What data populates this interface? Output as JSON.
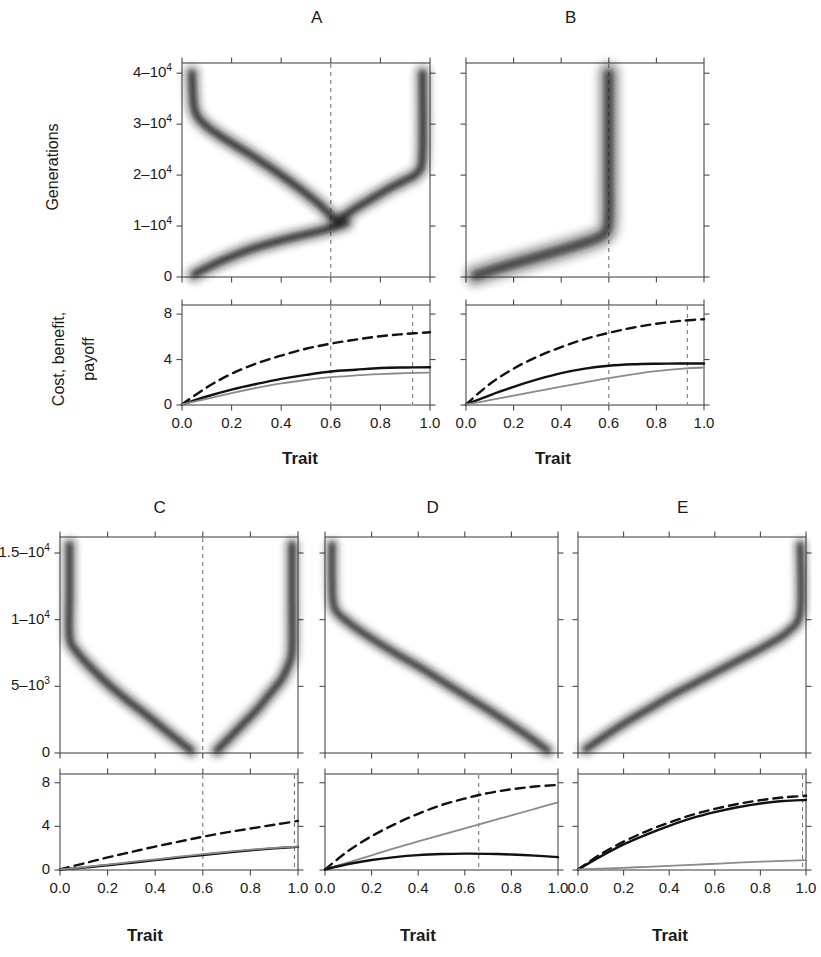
{
  "figure": {
    "width": 812,
    "height": 957,
    "background": "#ffffff",
    "axis_color": "#4a4a4a",
    "curve_solid_color": "#111111",
    "curve_gray_color": "#8a8a8a",
    "curve_dashed_color": "#111111",
    "density_color": "#1a1a1a"
  },
  "labels": {
    "generations_axis": "Generations",
    "cost_axis_line1": "Cost, benefit,",
    "cost_axis_line2": "payoff",
    "trait_axis": "Trait"
  },
  "panels": [
    {
      "id": "A",
      "letter": "A",
      "row": 1,
      "y_ticks_top": [
        "0",
        "1–10⁴",
        "2–10⁴",
        "3–10⁴",
        "4–10⁴"
      ],
      "y_values_top": [
        0,
        10000,
        20000,
        30000,
        40000
      ],
      "y_ticks_bottom": [
        "0",
        "4",
        "8"
      ],
      "y_values_bottom": [
        0,
        4,
        8
      ],
      "x_ticks": [
        "0.0",
        "0.2",
        "0.4",
        "0.6",
        "0.8",
        "1.0"
      ],
      "x_values": [
        0.0,
        0.2,
        0.4,
        0.6,
        0.8,
        1.0
      ],
      "vlines_top": [
        0.6
      ],
      "vlines_bottom": [
        0.6,
        0.93
      ]
    },
    {
      "id": "B",
      "letter": "B",
      "row": 1,
      "y_ticks_top": [],
      "y_ticks_bottom": [],
      "x_ticks": [
        "0.0",
        "0.2",
        "0.4",
        "0.6",
        "0.8",
        "1.0"
      ],
      "x_values": [
        0.0,
        0.2,
        0.4,
        0.6,
        0.8,
        1.0
      ],
      "vlines_top": [
        0.6
      ],
      "vlines_bottom": [
        0.6,
        0.93
      ]
    },
    {
      "id": "C",
      "letter": "C",
      "row": 2,
      "y_ticks_top": [
        "0",
        "5–10³",
        "1–10⁴",
        "1.5–10⁴"
      ],
      "y_values_top": [
        0,
        5000,
        10000,
        15000
      ],
      "y_ticks_bottom": [
        "0",
        "4",
        "8"
      ],
      "y_values_bottom": [
        0,
        4,
        8
      ],
      "x_ticks": [
        "0.0",
        "0.2",
        "0.4",
        "0.6",
        "0.8",
        "1.0"
      ],
      "x_values": [
        0.0,
        0.2,
        0.4,
        0.6,
        0.8,
        1.0
      ],
      "vlines_top": [
        0.6
      ],
      "vlines_bottom": [
        0.6,
        0.985
      ]
    },
    {
      "id": "D",
      "letter": "D",
      "row": 2,
      "y_ticks_top": [],
      "y_ticks_bottom": [],
      "x_ticks": [
        "0.0",
        "0.2",
        "0.4",
        "0.6",
        "0.8",
        "1.0"
      ],
      "x_values": [
        0.0,
        0.2,
        0.4,
        0.6,
        0.8,
        1.0
      ],
      "vlines_top": [],
      "vlines_bottom": [
        0.66
      ]
    },
    {
      "id": "E",
      "letter": "E",
      "row": 2,
      "y_ticks_top": [],
      "y_ticks_bottom": [],
      "x_ticks": [
        "0.0",
        "0.2",
        "0.4",
        "0.6",
        "0.8",
        "1.0"
      ],
      "x_values": [
        0.0,
        0.2,
        0.4,
        0.6,
        0.8,
        1.0
      ],
      "vlines_top": [],
      "vlines_bottom": [
        0.985
      ]
    }
  ],
  "chart_data": [
    {
      "type": "scatter",
      "panel": "A",
      "subplot": "top",
      "title": "A",
      "xlabel": "Trait",
      "ylabel": "Generations",
      "xlim": [
        0,
        1
      ],
      "ylim": [
        0,
        42000
      ],
      "xticks": [
        0.0,
        0.2,
        0.4,
        0.6,
        0.8,
        1.0
      ],
      "yticks": [
        0,
        10000,
        20000,
        30000,
        40000
      ],
      "ytick_labels": [
        "0",
        "1–10⁴",
        "2–10⁴",
        "3–10⁴",
        "4–10⁴"
      ],
      "grid": false,
      "legend": "none",
      "annotations": [
        "dashed vertical reference line at trait = 0.6"
      ],
      "description": "Evolutionary branching: population starts near trait 0.05, rises to ~0.62 by 1·10⁴ generations, then splits into two branches — one descending to trait ≈ 0.02 at 3·10⁴–4·10⁴ and one rising to trait ≈ 0.97.",
      "branches": [
        {
          "name": "main-ascent",
          "x": [
            0.05,
            0.1,
            0.18,
            0.28,
            0.4,
            0.52,
            0.6,
            0.66
          ],
          "y": [
            500,
            1800,
            3600,
            5500,
            7200,
            8600,
            9600,
            10600
          ]
        },
        {
          "name": "lower-branch-to-zero",
          "x": [
            0.62,
            0.56,
            0.47,
            0.37,
            0.26,
            0.16,
            0.09,
            0.05,
            0.04
          ],
          "y": [
            11000,
            14000,
            17500,
            21000,
            24500,
            27500,
            30000,
            33000,
            40000
          ]
        },
        {
          "name": "upper-branch-to-one",
          "x": [
            0.64,
            0.7,
            0.77,
            0.84,
            0.9,
            0.95,
            0.97,
            0.97
          ],
          "y": [
            11500,
            13500,
            15500,
            17500,
            19000,
            20500,
            24000,
            40000
          ]
        }
      ]
    },
    {
      "type": "line",
      "panel": "A",
      "subplot": "bottom",
      "xlabel": "Trait",
      "ylabel": "Cost, benefit, payoff",
      "xlim": [
        0,
        1
      ],
      "ylim": [
        0,
        8.8
      ],
      "xticks": [
        0.0,
        0.2,
        0.4,
        0.6,
        0.8,
        1.0
      ],
      "yticks": [
        0,
        4,
        8
      ],
      "grid": false,
      "legend": "none",
      "annotations": [
        "dashed vertical reference lines at trait = 0.6 and 0.93"
      ],
      "x": [
        0.0,
        0.1,
        0.2,
        0.3,
        0.4,
        0.5,
        0.6,
        0.7,
        0.8,
        0.9,
        1.0
      ],
      "series": [
        {
          "name": "benefit",
          "style": "dashed",
          "color": "#111111",
          "values": [
            0.05,
            1.55,
            2.75,
            3.65,
            4.35,
            4.95,
            5.4,
            5.75,
            6.05,
            6.25,
            6.4
          ]
        },
        {
          "name": "payoff",
          "style": "solid",
          "color": "#111111",
          "values": [
            0.05,
            0.75,
            1.35,
            1.85,
            2.3,
            2.65,
            2.95,
            3.1,
            3.25,
            3.3,
            3.32
          ]
        },
        {
          "name": "cost",
          "style": "solid-gray",
          "color": "#8a8a8a",
          "values": [
            0.05,
            0.55,
            1.05,
            1.5,
            1.9,
            2.2,
            2.45,
            2.6,
            2.72,
            2.8,
            2.85
          ]
        }
      ]
    },
    {
      "type": "scatter",
      "panel": "B",
      "subplot": "top",
      "title": "B",
      "xlabel": "Trait",
      "ylabel": "Generations",
      "xlim": [
        0,
        1
      ],
      "ylim": [
        0,
        42000
      ],
      "xticks": [
        0.0,
        0.2,
        0.4,
        0.6,
        0.8,
        1.0
      ],
      "grid": false,
      "legend": "none",
      "annotations": [
        "dashed vertical reference line at trait = 0.6"
      ],
      "description": "Convergence to a single stable trait value: population starts at trait ≈ 0.04, rises steeply and converges onto the evolutionarily stable state at trait ≈ 0.60, broadening into a stable cloud for the remainder of the run.",
      "branches": [
        {
          "name": "convergence",
          "x": [
            0.04,
            0.1,
            0.2,
            0.32,
            0.45,
            0.55,
            0.59,
            0.6,
            0.6,
            0.6,
            0.6
          ],
          "y": [
            300,
            1200,
            2600,
            4200,
            6000,
            7600,
            9000,
            12000,
            20000,
            30000,
            40000
          ]
        }
      ]
    },
    {
      "type": "line",
      "panel": "B",
      "subplot": "bottom",
      "xlabel": "Trait",
      "ylabel": "Cost, benefit, payoff",
      "xlim": [
        0,
        1
      ],
      "ylim": [
        0,
        8.8
      ],
      "xticks": [
        0.0,
        0.2,
        0.4,
        0.6,
        0.8,
        1.0
      ],
      "yticks": [
        0,
        4,
        8
      ],
      "grid": false,
      "legend": "none",
      "annotations": [
        "dashed vertical reference lines at trait = 0.6 and 0.93"
      ],
      "x": [
        0.0,
        0.1,
        0.2,
        0.3,
        0.4,
        0.5,
        0.6,
        0.7,
        0.8,
        0.9,
        1.0
      ],
      "series": [
        {
          "name": "benefit",
          "style": "dashed",
          "color": "#111111",
          "values": [
            0.05,
            1.85,
            3.2,
            4.25,
            5.1,
            5.8,
            6.35,
            6.8,
            7.15,
            7.4,
            7.55
          ]
        },
        {
          "name": "payoff",
          "style": "solid",
          "color": "#111111",
          "values": [
            0.05,
            0.85,
            1.6,
            2.25,
            2.8,
            3.2,
            3.45,
            3.58,
            3.63,
            3.65,
            3.65
          ]
        },
        {
          "name": "cost",
          "style": "solid-gray",
          "color": "#8a8a8a",
          "values": [
            0.05,
            0.42,
            0.82,
            1.22,
            1.62,
            2.0,
            2.37,
            2.7,
            2.98,
            3.18,
            3.3
          ]
        }
      ]
    },
    {
      "type": "scatter",
      "panel": "C",
      "subplot": "top",
      "title": "C",
      "xlabel": "Trait",
      "ylabel": "Generations",
      "xlim": [
        0,
        1
      ],
      "ylim": [
        0,
        16200
      ],
      "xticks": [
        0.0,
        0.2,
        0.4,
        0.6,
        0.8,
        1.0
      ],
      "yticks": [
        0,
        5000,
        10000,
        15000
      ],
      "ytick_labels": [
        "0",
        "5–10³",
        "1–10⁴",
        "1.5–10⁴"
      ],
      "grid": false,
      "legend": "none",
      "annotations": [
        "dashed vertical reference line at trait = 0.6"
      ],
      "description": "Immediate branching from the start: two lineages diverge from traits ≈ 0.55 and ≈ 0.66 at generation 0, spreading outward to trait ≈ 0.02 and ≈ 0.99 by ≈ 9·10³ generations, then remaining fixed at the boundaries.",
      "branches": [
        {
          "name": "left-branch",
          "x": [
            0.55,
            0.5,
            0.43,
            0.36,
            0.28,
            0.2,
            0.13,
            0.07,
            0.04,
            0.04,
            0.04
          ],
          "y": [
            200,
            900,
            1900,
            2900,
            4000,
            5200,
            6400,
            7600,
            8700,
            12000,
            15600
          ]
        },
        {
          "name": "right-branch",
          "x": [
            0.66,
            0.71,
            0.77,
            0.83,
            0.88,
            0.93,
            0.96,
            0.975,
            0.975,
            0.975
          ],
          "y": [
            200,
            1100,
            2200,
            3300,
            4400,
            5500,
            6600,
            7800,
            12000,
            15600
          ]
        }
      ]
    },
    {
      "type": "line",
      "panel": "C",
      "subplot": "bottom",
      "xlabel": "Trait",
      "ylabel": "Cost, benefit, payoff",
      "xlim": [
        0,
        1
      ],
      "ylim": [
        0,
        8.8
      ],
      "xticks": [
        0.0,
        0.2,
        0.4,
        0.6,
        0.8,
        1.0
      ],
      "yticks": [
        0,
        4,
        8
      ],
      "grid": false,
      "legend": "none",
      "annotations": [
        "dashed vertical reference lines at trait = 0.6 and 0.985"
      ],
      "x": [
        0.0,
        0.1,
        0.2,
        0.3,
        0.4,
        0.5,
        0.6,
        0.7,
        0.8,
        0.9,
        1.0
      ],
      "series": [
        {
          "name": "benefit",
          "style": "dashed",
          "color": "#111111",
          "values": [
            0.05,
            0.6,
            1.15,
            1.65,
            2.15,
            2.6,
            3.05,
            3.45,
            3.8,
            4.15,
            4.5
          ]
        },
        {
          "name": "payoff",
          "style": "solid",
          "color": "#111111",
          "values": [
            0.05,
            0.22,
            0.44,
            0.66,
            0.9,
            1.14,
            1.38,
            1.6,
            1.8,
            1.98,
            2.12
          ]
        },
        {
          "name": "cost",
          "style": "solid-gray",
          "color": "#8a8a8a",
          "values": [
            0.05,
            0.26,
            0.5,
            0.74,
            0.98,
            1.22,
            1.45,
            1.67,
            1.86,
            2.02,
            2.15
          ]
        }
      ]
    },
    {
      "type": "scatter",
      "panel": "D",
      "subplot": "top",
      "title": "D",
      "xlabel": "Trait",
      "ylabel": "Generations",
      "xlim": [
        0,
        1
      ],
      "ylim": [
        0,
        16200
      ],
      "xticks": [
        0.0,
        0.2,
        0.4,
        0.6,
        0.8,
        1.0
      ],
      "grid": false,
      "legend": "none",
      "annotations": [],
      "description": "Monotonic decline to the lower boundary: population starts at trait ≈ 0.96 at generation 0 and steadily decreases, reaching trait ≈ 0.02 by ≈ 1.1·10⁴ generations, where it remains pinned for the rest of the run.",
      "branches": [
        {
          "name": "descent",
          "x": [
            0.955,
            0.86,
            0.74,
            0.63,
            0.52,
            0.41,
            0.3,
            0.19,
            0.1,
            0.04,
            0.03,
            0.03
          ],
          "y": [
            200,
            1400,
            2800,
            4000,
            5200,
            6400,
            7500,
            8700,
            9800,
            10900,
            13000,
            15600
          ]
        }
      ]
    },
    {
      "type": "line",
      "panel": "D",
      "subplot": "bottom",
      "xlabel": "Trait",
      "ylabel": "Cost, benefit, payoff",
      "xlim": [
        0,
        1
      ],
      "ylim": [
        0,
        8.8
      ],
      "xticks": [
        0.0,
        0.2,
        0.4,
        0.6,
        0.8,
        1.0
      ],
      "yticks": [
        0,
        4,
        8
      ],
      "grid": false,
      "legend": "none",
      "annotations": [
        "dashed vertical reference line at trait = 0.66"
      ],
      "x": [
        0.0,
        0.1,
        0.2,
        0.3,
        0.4,
        0.5,
        0.6,
        0.7,
        0.8,
        0.9,
        1.0
      ],
      "series": [
        {
          "name": "benefit",
          "style": "dashed",
          "color": "#111111",
          "values": [
            0.05,
            1.75,
            3.1,
            4.2,
            5.15,
            5.95,
            6.55,
            7.05,
            7.4,
            7.65,
            7.8
          ]
        },
        {
          "name": "cost",
          "style": "solid-gray",
          "color": "#8a8a8a",
          "values": [
            0.05,
            0.7,
            1.35,
            2.0,
            2.62,
            3.22,
            3.82,
            4.42,
            5.0,
            5.6,
            6.2
          ]
        },
        {
          "name": "payoff",
          "style": "solid",
          "color": "#111111",
          "values": [
            0.05,
            0.55,
            0.92,
            1.18,
            1.36,
            1.46,
            1.5,
            1.48,
            1.42,
            1.32,
            1.18
          ]
        }
      ]
    },
    {
      "type": "scatter",
      "panel": "E",
      "subplot": "top",
      "title": "E",
      "xlabel": "Trait",
      "ylabel": "Generations",
      "xlim": [
        0,
        1
      ],
      "ylim": [
        0,
        16200
      ],
      "xticks": [
        0.0,
        0.2,
        0.4,
        0.6,
        0.8,
        1.0
      ],
      "grid": false,
      "legend": "none",
      "annotations": [],
      "description": "Monotonic rise to the upper boundary: population starts at trait ≈ 0.03 at generation 0 and increases steadily, reaching trait ≈ 0.98 by ≈ 1.1·10⁴ generations and remaining there.",
      "branches": [
        {
          "name": "ascent",
          "x": [
            0.035,
            0.12,
            0.22,
            0.32,
            0.42,
            0.52,
            0.62,
            0.72,
            0.82,
            0.92,
            0.975,
            0.975
          ],
          "y": [
            300,
            1300,
            2400,
            3400,
            4400,
            5300,
            6200,
            7100,
            8000,
            9100,
            10600,
            15600
          ]
        }
      ]
    },
    {
      "type": "line",
      "panel": "E",
      "subplot": "bottom",
      "xlabel": "Trait",
      "ylabel": "Cost, benefit, payoff",
      "xlim": [
        0,
        1
      ],
      "ylim": [
        0,
        8.8
      ],
      "xticks": [
        0.0,
        0.2,
        0.4,
        0.6,
        0.8,
        1.0
      ],
      "yticks": [
        0,
        4,
        8
      ],
      "grid": false,
      "legend": "none",
      "annotations": [
        "dashed vertical reference line at trait = 0.985"
      ],
      "x": [
        0.0,
        0.1,
        0.2,
        0.3,
        0.4,
        0.5,
        0.6,
        0.7,
        0.8,
        0.9,
        1.0
      ],
      "series": [
        {
          "name": "benefit",
          "style": "dashed",
          "color": "#111111",
          "values": [
            0.05,
            1.45,
            2.6,
            3.55,
            4.35,
            5.05,
            5.6,
            6.05,
            6.4,
            6.65,
            6.8
          ]
        },
        {
          "name": "payoff",
          "style": "solid",
          "color": "#111111",
          "values": [
            0.05,
            1.25,
            2.35,
            3.25,
            4.05,
            4.75,
            5.3,
            5.75,
            6.1,
            6.32,
            6.42
          ]
        },
        {
          "name": "cost",
          "style": "solid-gray",
          "color": "#8a8a8a",
          "values": [
            0.05,
            0.12,
            0.2,
            0.29,
            0.38,
            0.47,
            0.57,
            0.67,
            0.76,
            0.84,
            0.9
          ]
        }
      ]
    }
  ]
}
